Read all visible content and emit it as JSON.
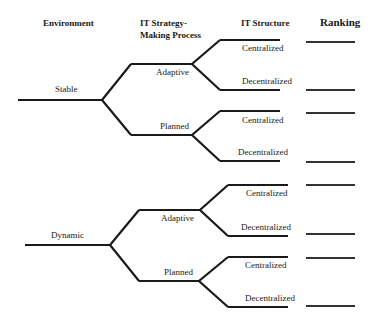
{
  "headers": {
    "environment": "Environment",
    "strategy_line1": "IT Strategy-",
    "strategy_line2": "Making Process",
    "structure": "IT Structure",
    "ranking": "Ranking"
  },
  "tree": {
    "environments": [
      {
        "label": "Stable",
        "strategies": [
          {
            "label": "Adaptive",
            "structures": [
              {
                "label": "Centralized"
              },
              {
                "label": "Decentralized"
              }
            ]
          },
          {
            "label": "Planned",
            "structures": [
              {
                "label": "Centralized"
              },
              {
                "label": "Decentralized"
              }
            ]
          }
        ]
      },
      {
        "label": "Dynamic",
        "strategies": [
          {
            "label": "Adaptive",
            "structures": [
              {
                "label": "Centralized"
              },
              {
                "label": "Decentralized"
              }
            ]
          },
          {
            "label": "Planned",
            "structures": [
              {
                "label": "Centralized"
              },
              {
                "label": "Decentralized"
              }
            ]
          }
        ]
      }
    ]
  },
  "ranking_blanks": 8,
  "colors": {
    "line": "#1a1a1a",
    "rank_line": "#333333"
  }
}
